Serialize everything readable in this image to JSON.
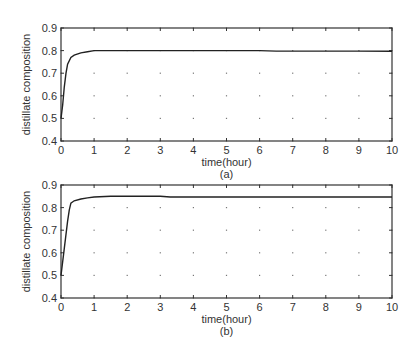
{
  "chart_data": [
    {
      "type": "line",
      "panel_label": "(a)",
      "title": "",
      "xlabel": "time(hour)",
      "ylabel": "distillate composition",
      "xlim": [
        0,
        10
      ],
      "ylim": [
        0.4,
        0.9
      ],
      "xticks": [
        "0",
        "1",
        "2",
        "3",
        "4",
        "5",
        "6",
        "7",
        "8",
        "9",
        "10"
      ],
      "yticks": [
        "0.4",
        "0.5",
        "0.6",
        "0.7",
        "0.8",
        "0.9"
      ],
      "grid": "dotted",
      "legend": "none",
      "series": [
        {
          "name": "distillate composition",
          "x": [
            0,
            0.05,
            0.1,
            0.15,
            0.2,
            0.3,
            0.4,
            0.6,
            0.8,
            1.0,
            1.5,
            2,
            3,
            4,
            5,
            6,
            6.5,
            7,
            8,
            9,
            10
          ],
          "y": [
            0.5,
            0.56,
            0.64,
            0.7,
            0.74,
            0.77,
            0.78,
            0.79,
            0.795,
            0.8,
            0.8,
            0.8,
            0.8,
            0.8,
            0.8,
            0.8,
            0.798,
            0.798,
            0.798,
            0.798,
            0.797
          ]
        }
      ]
    },
    {
      "type": "line",
      "panel_label": "(b)",
      "title": "",
      "xlabel": "time(hour)",
      "ylabel": "distillate composition",
      "xlim": [
        0,
        10
      ],
      "ylim": [
        0.4,
        0.9
      ],
      "xticks": [
        "0",
        "1",
        "2",
        "3",
        "4",
        "5",
        "6",
        "7",
        "8",
        "9",
        "10"
      ],
      "yticks": [
        "0.4",
        "0.5",
        "0.6",
        "0.7",
        "0.8",
        "0.9"
      ],
      "grid": "dotted",
      "legend": "none",
      "series": [
        {
          "name": "distillate composition",
          "x": [
            0,
            0.1,
            0.2,
            0.25,
            0.3,
            0.4,
            0.6,
            0.8,
            1.0,
            1.5,
            2,
            3,
            3.3,
            4,
            5,
            6,
            7,
            8,
            9,
            10
          ],
          "y": [
            0.5,
            0.62,
            0.74,
            0.79,
            0.82,
            0.83,
            0.838,
            0.843,
            0.847,
            0.85,
            0.85,
            0.85,
            0.847,
            0.847,
            0.847,
            0.847,
            0.847,
            0.847,
            0.847,
            0.847
          ]
        }
      ]
    }
  ]
}
